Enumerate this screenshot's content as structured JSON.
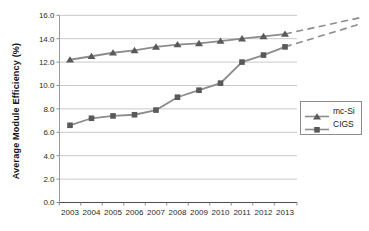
{
  "chart_data": {
    "type": "line",
    "title": "",
    "xlabel": "",
    "ylabel": "Average Module Efficiency (%)",
    "categories": [
      "2003",
      "2004",
      "2005",
      "2006",
      "2007",
      "2008",
      "2009",
      "2010",
      "2011",
      "2012",
      "2013"
    ],
    "yticks": [
      "0.0",
      "2.0",
      "4.0",
      "6.0",
      "8.0",
      "10.0",
      "12.0",
      "14.0",
      "16.0"
    ],
    "ylim": [
      0,
      16
    ],
    "grid": "horizontal",
    "legend_position": "right",
    "series": [
      {
        "name": "mc-Si",
        "marker": "triangle",
        "color": "#8c8c8c",
        "marker_color": "#595959",
        "values": [
          12.2,
          12.5,
          12.8,
          13.0,
          13.3,
          13.5,
          13.6,
          13.8,
          14.0,
          14.2,
          14.4
        ]
      },
      {
        "name": "CIGS",
        "marker": "square",
        "color": "#8c8c8c",
        "marker_color": "#595959",
        "values": [
          6.6,
          7.2,
          7.4,
          7.5,
          7.9,
          9.0,
          9.6,
          10.2,
          12.0,
          12.6,
          13.3
        ]
      }
    ],
    "projections": [
      {
        "series": "mc-Si",
        "style": "dashed",
        "from": {
          "category": "2013",
          "value": 14.4
        },
        "to": {
          "category_index": 13.5,
          "value": 15.8
        }
      },
      {
        "series": "CIGS",
        "style": "dashed",
        "from": {
          "category": "2013",
          "value": 13.3
        },
        "to": {
          "category_index": 13.4,
          "value": 15.2
        }
      }
    ]
  },
  "colors": {
    "grid": "#c9c9c9",
    "y_axis": "#9a9a9a",
    "x_axis": "#4d4d4d",
    "tick": "#8c8c8c",
    "line": "#8c8c8c",
    "text": "#2b2b2b"
  }
}
